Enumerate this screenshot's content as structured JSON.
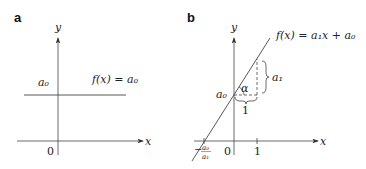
{
  "panels": [
    {
      "id": "a",
      "label": "a",
      "y_axis_label": "y",
      "x_axis_label": "x",
      "origin_label": "0",
      "intercept_label": "a₀",
      "function_label": "f(x) = a₀"
    },
    {
      "id": "b",
      "label": "b",
      "y_axis_label": "y",
      "x_axis_label": "x",
      "origin_label": "0",
      "intercept_label": "a₀",
      "function_label": "f(x) = a₁x + a₀",
      "angle_label": "α",
      "run_label": "1",
      "rise_label": "a₁",
      "x_tick_label": "1",
      "root_label_sign": "−",
      "root_label_num": "a₀",
      "root_label_den": "a₁"
    }
  ]
}
